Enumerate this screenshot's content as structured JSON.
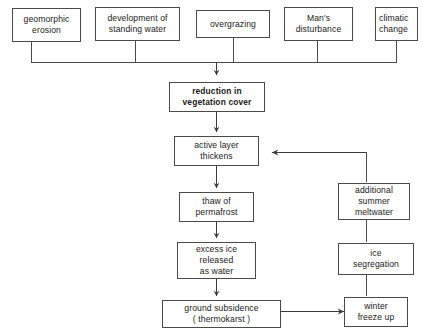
{
  "diagram": {
    "stroke_color": "#4a4a4a",
    "text_color": "#1a1a1a",
    "background": "#ffffff"
  },
  "causes": [
    {
      "id": "geomorphic-erosion",
      "label": "geomorphic\nerosion"
    },
    {
      "id": "development-of-standing-water",
      "label": "development of\nstanding water"
    },
    {
      "id": "overgrazing",
      "label": "overgrazing"
    },
    {
      "id": "mans-disturbance",
      "label": "Man's\ndisturbance"
    },
    {
      "id": "climatic-change",
      "label": "climatic\nchange"
    }
  ],
  "main_chain": [
    {
      "id": "reduction-in-vegetation-cover",
      "label": "reduction in\nvegetation cover",
      "emphasis": "bold"
    },
    {
      "id": "active-layer-thickens",
      "label": "active layer\nthickens"
    },
    {
      "id": "thaw-of-permafrost",
      "label": "thaw of\npermafrost"
    },
    {
      "id": "excess-ice-released-as-water",
      "label": "excess ice\nreleased\nas water"
    },
    {
      "id": "ground-subsidence-thermokarst",
      "label": "ground subsidence\n( thermokarst )"
    }
  ],
  "feedback_loop": [
    {
      "id": "winter-freeze-up",
      "label": "winter\nfreeze up"
    },
    {
      "id": "ice-segregation",
      "label": "ice\nsegregation"
    },
    {
      "id": "additional-summer-meltwater",
      "label": "additional\nsummer\nmeltwater"
    }
  ],
  "edges": [
    {
      "from": "causes-bus",
      "to": "reduction-in-vegetation-cover",
      "arrow": true
    },
    {
      "from": "reduction-in-vegetation-cover",
      "to": "active-layer-thickens",
      "arrow": true
    },
    {
      "from": "active-layer-thickens",
      "to": "thaw-of-permafrost",
      "arrow": true
    },
    {
      "from": "thaw-of-permafrost",
      "to": "excess-ice-released-as-water",
      "arrow": true
    },
    {
      "from": "excess-ice-released-as-water",
      "to": "ground-subsidence-thermokarst",
      "arrow": true
    },
    {
      "from": "ground-subsidence-thermokarst",
      "to": "winter-freeze-up",
      "arrow": true
    },
    {
      "from": "winter-freeze-up",
      "to": "ice-segregation",
      "arrow": false
    },
    {
      "from": "ice-segregation",
      "to": "additional-summer-meltwater",
      "arrow": false
    },
    {
      "from": "additional-summer-meltwater",
      "to": "active-layer-thickens",
      "arrow": true
    }
  ]
}
